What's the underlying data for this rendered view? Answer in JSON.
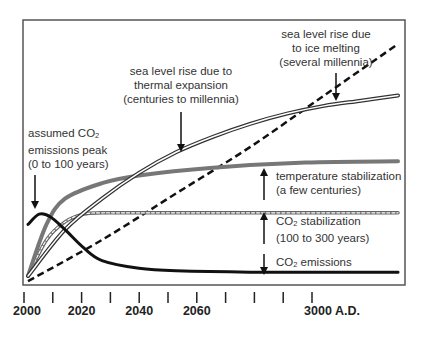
{
  "chart_data": {
    "type": "line",
    "title": "",
    "xlabel": "",
    "ylabel": "",
    "x_ticks": [
      "2000",
      "",
      "2020",
      "",
      "2040",
      "",
      "2060",
      "",
      "",
      "",
      "3000 A.D."
    ],
    "x_tick_count": 11,
    "ylim": [
      0,
      1
    ],
    "grid": false,
    "series": [
      {
        "name": "CO2 emissions",
        "style": "black-solid",
        "x": [
          0,
          0.3,
          0.6,
          1,
          1.5,
          2,
          3,
          4,
          6,
          10
        ],
        "values": [
          0.2,
          0.24,
          0.23,
          0.18,
          0.11,
          0.06,
          0.03,
          0.02,
          0.015,
          0.015
        ]
      },
      {
        "name": "CO2 stabilization",
        "style": "gray-dashed",
        "x": [
          0,
          0.5,
          1,
          1.5,
          2,
          3,
          10
        ],
        "values": [
          0,
          0.14,
          0.21,
          0.24,
          0.245,
          0.245,
          0.245
        ]
      },
      {
        "name": "temperature stabilization",
        "style": "gray-thick",
        "x": [
          0,
          0.5,
          1,
          2,
          3,
          5,
          7.5,
          10
        ],
        "values": [
          0,
          0.2,
          0.3,
          0.36,
          0.39,
          0.42,
          0.44,
          0.445
        ]
      },
      {
        "name": "sea level rise due to thermal expansion",
        "style": "double-line",
        "x": [
          0,
          1,
          2,
          3,
          4,
          5,
          6,
          7,
          8,
          9,
          10
        ],
        "values": [
          0,
          0.18,
          0.3,
          0.4,
          0.48,
          0.54,
          0.59,
          0.63,
          0.66,
          0.68,
          0.7
        ]
      },
      {
        "name": "sea level rise due to ice melting",
        "style": "black-dashed",
        "x": [
          0,
          2,
          4,
          6,
          8,
          10
        ],
        "values": [
          -0.02,
          0.14,
          0.32,
          0.5,
          0.7,
          0.9
        ]
      }
    ]
  },
  "annotations": {
    "emissions_peak": {
      "line1": "assumed CO",
      "sub1": "2",
      "line2": "emissions peak",
      "line3": "(0 to 100 years)"
    },
    "thermal": {
      "line1": "sea level rise due to",
      "line2": "thermal expansion",
      "line3": "(centuries to millennia)"
    },
    "ice": {
      "line1": "sea level rise due",
      "line2": "to ice melting",
      "line3": "(several millennia)"
    },
    "temperature": {
      "line1": "temperature stabilization",
      "line2": "(a few centuries)"
    },
    "co2_stab": {
      "line1a": "CO",
      "sub": "2",
      "line1b": " stabilization",
      "line2": "(100 to 300 years)"
    },
    "co2_emis": {
      "line1a": "CO",
      "sub": "2",
      "line1b": " emissions"
    }
  },
  "axis": {
    "labels": [
      {
        "text": "2000",
        "tick": 0
      },
      {
        "text": "2020",
        "tick": 2
      },
      {
        "text": "2040",
        "tick": 4
      },
      {
        "text": "2060",
        "tick": 6
      },
      {
        "text": "3000 A.D.",
        "tick": 10
      }
    ]
  },
  "colors": {
    "black": "#111111",
    "gray": "#777777",
    "frame": "#555555"
  }
}
